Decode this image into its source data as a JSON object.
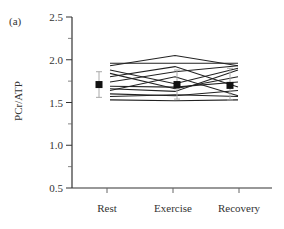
{
  "panel_label": "(a)",
  "chart_data": {
    "type": "line",
    "title": "",
    "panel_label": "(a)",
    "xlabel": "",
    "ylabel": "PCr/ATP",
    "categories": [
      "Rest",
      "Exercise",
      "Recovery"
    ],
    "ylim": [
      0.5,
      2.5
    ],
    "yticks": [
      "0.5",
      "1.0",
      "1.5",
      "2.0",
      "2.5"
    ],
    "grid": false,
    "legend": null,
    "mean": {
      "values": [
        1.71,
        1.71,
        1.7
      ],
      "error_upper": [
        1.86,
        1.88,
        1.9
      ],
      "error_lower": [
        1.56,
        1.54,
        1.53
      ]
    },
    "series": [
      {
        "name": "subject-1",
        "values": [
          1.96,
          1.96,
          1.96
        ]
      },
      {
        "name": "subject-2",
        "values": [
          1.93,
          2.05,
          1.93
        ]
      },
      {
        "name": "subject-3",
        "values": [
          1.88,
          1.72,
          1.9
        ]
      },
      {
        "name": "subject-4",
        "values": [
          1.84,
          1.66,
          1.8
        ]
      },
      {
        "name": "subject-5",
        "values": [
          1.8,
          1.92,
          1.68
        ]
      },
      {
        "name": "subject-6",
        "values": [
          1.74,
          1.86,
          1.93
        ]
      },
      {
        "name": "subject-7",
        "values": [
          1.69,
          1.68,
          1.74
        ]
      },
      {
        "name": "subject-8",
        "values": [
          1.66,
          1.63,
          1.88
        ]
      },
      {
        "name": "subject-9",
        "values": [
          1.64,
          1.8,
          1.58
        ]
      },
      {
        "name": "subject-10",
        "values": [
          1.6,
          1.58,
          1.64
        ]
      },
      {
        "name": "subject-11",
        "values": [
          1.57,
          1.59,
          1.57
        ]
      },
      {
        "name": "subject-12",
        "values": [
          1.53,
          1.52,
          1.53
        ]
      }
    ]
  }
}
